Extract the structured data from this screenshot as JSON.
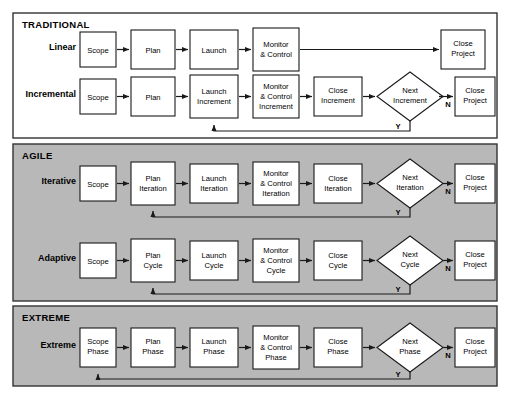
{
  "figure": {
    "background_color": "#ffffff",
    "panel_traditional_color": "#ffffff",
    "panel_agile_color": "#b8b8b8",
    "panel_extreme_color": "#b8b8b8",
    "box_fill": "#ffffff",
    "line_color": "#1a1a1a"
  },
  "sections": [
    {
      "title": "TRADITIONAL"
    },
    {
      "title": "AGILE"
    },
    {
      "title": "EXTREME"
    }
  ],
  "rows": [
    {
      "label": "Linear",
      "section": "TRADITIONAL",
      "nodes": [
        {
          "type": "box",
          "lines": [
            "Scope"
          ]
        },
        {
          "type": "box",
          "lines": [
            "Plan"
          ]
        },
        {
          "type": "box",
          "lines": [
            "Launch"
          ]
        },
        {
          "type": "box",
          "lines": [
            "Monitor",
            "& Control"
          ]
        },
        {
          "type": "box",
          "lines": [
            "Close",
            "Project"
          ]
        }
      ],
      "decision_labels": [],
      "has_loop": false
    },
    {
      "label": "Incremental",
      "section": "TRADITIONAL",
      "nodes": [
        {
          "type": "box",
          "lines": [
            "Scope"
          ]
        },
        {
          "type": "box",
          "lines": [
            "Plan"
          ]
        },
        {
          "type": "box",
          "lines": [
            "Launch",
            "Increment"
          ]
        },
        {
          "type": "box",
          "lines": [
            "Monitor",
            "& Control",
            "Increment"
          ]
        },
        {
          "type": "box",
          "lines": [
            "Close",
            "Increment"
          ]
        },
        {
          "type": "diamond",
          "lines": [
            "Next",
            "Increment"
          ]
        },
        {
          "type": "box",
          "lines": [
            "Close",
            "Project"
          ]
        }
      ],
      "decision_labels": [
        "Y",
        "N"
      ],
      "has_loop": true,
      "loop_target": "Launch Increment"
    },
    {
      "label": "Iterative",
      "section": "AGILE",
      "nodes": [
        {
          "type": "box",
          "lines": [
            "Scope"
          ]
        },
        {
          "type": "box",
          "lines": [
            "Plan",
            "Iteration"
          ]
        },
        {
          "type": "box",
          "lines": [
            "Launch",
            "Iteration"
          ]
        },
        {
          "type": "box",
          "lines": [
            "Monitor",
            "& Control",
            "Iteration"
          ]
        },
        {
          "type": "box",
          "lines": [
            "Close",
            "Iteration"
          ]
        },
        {
          "type": "diamond",
          "lines": [
            "Next",
            "Iteration"
          ]
        },
        {
          "type": "box",
          "lines": [
            "Close",
            "Project"
          ]
        }
      ],
      "decision_labels": [
        "Y",
        "N"
      ],
      "has_loop": true,
      "loop_target": "Plan Iteration"
    },
    {
      "label": "Adaptive",
      "section": "AGILE",
      "nodes": [
        {
          "type": "box",
          "lines": [
            "Scope"
          ]
        },
        {
          "type": "box",
          "lines": [
            "Plan",
            "Cycle"
          ]
        },
        {
          "type": "box",
          "lines": [
            "Launch",
            "Cycle"
          ]
        },
        {
          "type": "box",
          "lines": [
            "Monitor",
            "& Control",
            "Cycle"
          ]
        },
        {
          "type": "box",
          "lines": [
            "Close",
            "Cycle"
          ]
        },
        {
          "type": "diamond",
          "lines": [
            "Next",
            "Cycle"
          ]
        },
        {
          "type": "box",
          "lines": [
            "Close",
            "Project"
          ]
        }
      ],
      "decision_labels": [
        "Y",
        "N"
      ],
      "has_loop": true,
      "loop_target": "Plan Cycle"
    },
    {
      "label": "Extreme",
      "section": "EXTREME",
      "nodes": [
        {
          "type": "box",
          "lines": [
            "Scope",
            "Phase"
          ]
        },
        {
          "type": "box",
          "lines": [
            "Plan",
            "Phase"
          ]
        },
        {
          "type": "box",
          "lines": [
            "Launch",
            "Phase"
          ]
        },
        {
          "type": "box",
          "lines": [
            "Monitor",
            "& Control",
            "Phase"
          ]
        },
        {
          "type": "box",
          "lines": [
            "Close",
            "Phase"
          ]
        },
        {
          "type": "diamond",
          "lines": [
            "Next",
            "Phase"
          ]
        },
        {
          "type": "box",
          "lines": [
            "Close",
            "Project"
          ]
        }
      ],
      "decision_labels": [
        "Y",
        "N"
      ],
      "has_loop": true,
      "loop_target": "Scope Phase"
    }
  ]
}
